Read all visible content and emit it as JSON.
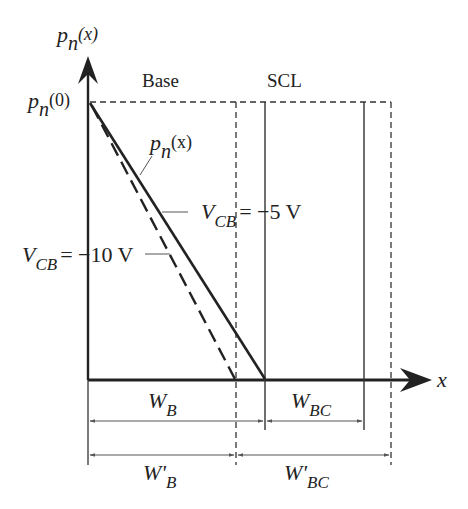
{
  "diagram": {
    "y_axis_label": {
      "main": "p",
      "sub": "n",
      "paren": "(x)"
    },
    "y_intercept_label": {
      "main": "p",
      "sub": "n",
      "paren": "(0)"
    },
    "x_axis_label": "x",
    "region_labels": {
      "base": "Base",
      "scl": "SCL"
    },
    "curve_label": {
      "main": "p",
      "sub": "n",
      "paren": "(x)"
    },
    "curves": [
      {
        "name": "VCB = -5 V",
        "style": "solid",
        "label_main": "V",
        "label_sub": "CB",
        "label_value": "= −5 V"
      },
      {
        "name": "VCB = -10 V",
        "style": "dashed",
        "label_main": "V",
        "label_sub": "CB",
        "label_value": "= −10 V"
      }
    ],
    "dimensions": {
      "wb": {
        "main": "W",
        "sub": "B"
      },
      "wbc": {
        "main": "W",
        "sub": "BC"
      },
      "wb_prime": {
        "main": "W'",
        "sub": "B"
      },
      "wbc_prime": {
        "main": "W'",
        "sub": "BC"
      }
    },
    "colors": {
      "line": "#222222",
      "thin": "#555555",
      "background": "#ffffff"
    }
  }
}
